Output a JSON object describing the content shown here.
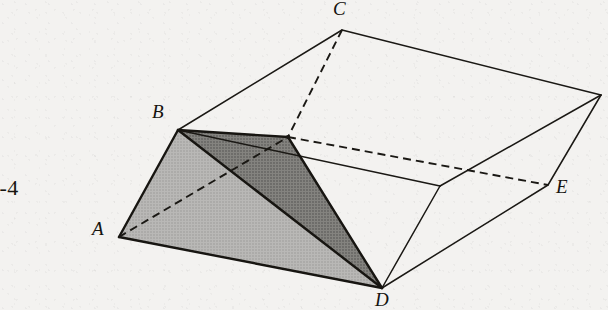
{
  "figure": {
    "number_label": "3-4",
    "caption": "",
    "background_color": "#f2f1ef",
    "ink_color": "#1a1814"
  },
  "labels": [
    {
      "id": "A",
      "text": "A",
      "x": 92,
      "y": 228
    },
    {
      "id": "B",
      "text": "B",
      "x": 152,
      "y": 110
    },
    {
      "id": "C",
      "text": "C",
      "x": 333,
      "y": 2
    },
    {
      "id": "D",
      "text": "D",
      "x": 375,
      "y": 292
    },
    {
      "id": "E",
      "text": "E",
      "x": 556,
      "y": 177
    }
  ],
  "geometry": {
    "vertices": {
      "A": {
        "x": 119,
        "y": 237
      },
      "B": {
        "x": 178,
        "y": 130
      },
      "C": {
        "x": 342,
        "y": 30
      },
      "D": {
        "x": 382,
        "y": 288
      },
      "E": {
        "x": 548,
        "y": 185
      },
      "F": {
        "x": 288,
        "y": 137
      },
      "G": {
        "x": 601,
        "y": 95
      },
      "H": {
        "x": 440,
        "y": 186
      },
      "I": {
        "x": 297,
        "y": 180
      }
    },
    "solid_edges": [
      {
        "name": "A-B",
        "from": "A",
        "to": "B"
      },
      {
        "name": "A-D",
        "from": "A",
        "to": "D"
      },
      {
        "name": "B-D",
        "from": "B",
        "to": "D"
      },
      {
        "name": "B-F",
        "from": "B",
        "to": "F"
      },
      {
        "name": "F-D",
        "from": "F",
        "to": "D"
      },
      {
        "name": "B-C",
        "from": "B",
        "to": "C"
      },
      {
        "name": "C-G",
        "from": "C",
        "to": "G"
      },
      {
        "name": "G-E",
        "from": "G",
        "to": "E"
      },
      {
        "name": "D-E",
        "from": "D",
        "to": "E"
      },
      {
        "name": "D-H",
        "from": "D",
        "to": "H"
      },
      {
        "name": "H-G",
        "from": "H",
        "to": "G"
      },
      {
        "name": "B-H",
        "from": "B",
        "to": "H"
      }
    ],
    "dashed_edges": [
      {
        "name": "A-F-hidden",
        "from": "A",
        "to": "F"
      },
      {
        "name": "C-F-hidden",
        "from": "C",
        "to": "F"
      },
      {
        "name": "F-E-hidden",
        "from": "F",
        "to": "E"
      }
    ],
    "shaded_faces": [
      {
        "name": "face-ABD-light",
        "points": "A,B,D",
        "color": "#b4b3b1"
      },
      {
        "name": "face-BFD-dark",
        "points": "B,F,D",
        "color": "#7e7d7b"
      }
    ]
  }
}
